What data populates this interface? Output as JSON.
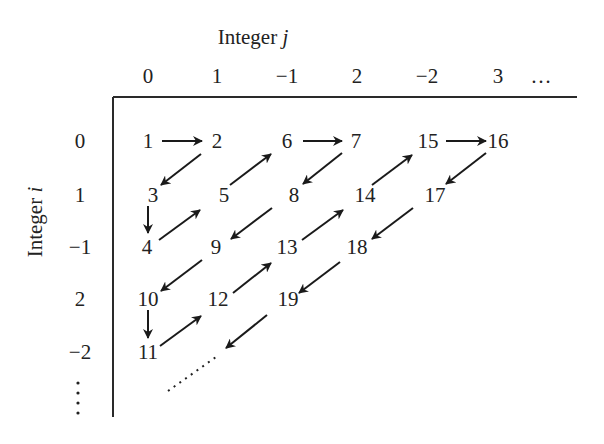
{
  "title": {
    "column_axis": {
      "prefix": "Integer ",
      "var": "j",
      "x": 253,
      "y": 44
    },
    "row_axis": {
      "prefix": "Integer ",
      "var": "i",
      "x": 48,
      "y": 228
    }
  },
  "columns": [
    {
      "label": "0",
      "x": 148
    },
    {
      "label": "1",
      "x": 217
    },
    {
      "label": "−1",
      "x": 287
    },
    {
      "label": "2",
      "x": 357
    },
    {
      "label": "−2",
      "x": 427
    },
    {
      "label": "3",
      "x": 498
    },
    {
      "label": "…",
      "x": 541
    }
  ],
  "column_label_y": 83,
  "rows": [
    {
      "label": "0",
      "y": 148
    },
    {
      "label": "1",
      "y": 202
    },
    {
      "label": "−1",
      "y": 254
    },
    {
      "label": "2",
      "y": 306
    },
    {
      "label": "−2",
      "y": 359
    }
  ],
  "row_label_x": 80,
  "row_ellipsis": {
    "x": 78,
    "y_start": 383,
    "y_end": 413,
    "count": 4
  },
  "axes": {
    "horizontal": {
      "x1": 113,
      "y1": 97,
      "x2": 577,
      "y2": 97
    },
    "vertical": {
      "x1": 113,
      "y1": 97,
      "x2": 113,
      "y2": 417
    }
  },
  "cells": [
    {
      "n": "1",
      "x": 148,
      "y": 148
    },
    {
      "n": "2",
      "x": 217,
      "y": 148
    },
    {
      "n": "3",
      "x": 153,
      "y": 202
    },
    {
      "n": "4",
      "x": 147,
      "y": 254
    },
    {
      "n": "5",
      "x": 224,
      "y": 202
    },
    {
      "n": "6",
      "x": 287,
      "y": 148
    },
    {
      "n": "7",
      "x": 356,
      "y": 148
    },
    {
      "n": "8",
      "x": 294,
      "y": 202
    },
    {
      "n": "9",
      "x": 216,
      "y": 254
    },
    {
      "n": "10",
      "x": 148,
      "y": 306
    },
    {
      "n": "11",
      "x": 148,
      "y": 359
    },
    {
      "n": "12",
      "x": 218,
      "y": 306
    },
    {
      "n": "13",
      "x": 287,
      "y": 254
    },
    {
      "n": "14",
      "x": 365,
      "y": 202
    },
    {
      "n": "15",
      "x": 428,
      "y": 148
    },
    {
      "n": "16",
      "x": 498,
      "y": 148
    },
    {
      "n": "17",
      "x": 435,
      "y": 202
    },
    {
      "n": "18",
      "x": 357,
      "y": 254
    },
    {
      "n": "19",
      "x": 288,
      "y": 306
    }
  ],
  "arrows": [
    {
      "from": "1",
      "to": "2",
      "x1": 162,
      "y1": 141,
      "x2": 202,
      "y2": 141
    },
    {
      "from": "2",
      "to": "3",
      "x1": 201,
      "y1": 154,
      "x2": 161,
      "y2": 185
    },
    {
      "from": "3",
      "to": "4",
      "x1": 148,
      "y1": 206,
      "x2": 148,
      "y2": 233
    },
    {
      "from": "4",
      "to": "5",
      "x1": 159,
      "y1": 240,
      "x2": 200,
      "y2": 210
    },
    {
      "from": "5",
      "to": "6",
      "x1": 230,
      "y1": 185,
      "x2": 271,
      "y2": 154
    },
    {
      "from": "6",
      "to": "7",
      "x1": 303,
      "y1": 141,
      "x2": 342,
      "y2": 141
    },
    {
      "from": "7",
      "to": "8",
      "x1": 342,
      "y1": 153,
      "x2": 303,
      "y2": 184
    },
    {
      "from": "8",
      "to": "9",
      "x1": 272,
      "y1": 208,
      "x2": 231,
      "y2": 239
    },
    {
      "from": "9",
      "to": "10",
      "x1": 202,
      "y1": 260,
      "x2": 161,
      "y2": 291
    },
    {
      "from": "10",
      "to": "11",
      "x1": 148,
      "y1": 310,
      "x2": 148,
      "y2": 338
    },
    {
      "from": "11",
      "to": "12",
      "x1": 160,
      "y1": 346,
      "x2": 201,
      "y2": 316
    },
    {
      "from": "12",
      "to": "13",
      "x1": 233,
      "y1": 293,
      "x2": 271,
      "y2": 263
    },
    {
      "from": "13",
      "to": "14",
      "x1": 302,
      "y1": 240,
      "x2": 343,
      "y2": 210
    },
    {
      "from": "14",
      "to": "15",
      "x1": 372,
      "y1": 185,
      "x2": 412,
      "y2": 155
    },
    {
      "from": "15",
      "to": "16",
      "x1": 446,
      "y1": 141,
      "x2": 486,
      "y2": 141
    },
    {
      "from": "16",
      "to": "17",
      "x1": 486,
      "y1": 153,
      "x2": 446,
      "y2": 184
    },
    {
      "from": "17",
      "to": "18",
      "x1": 413,
      "y1": 208,
      "x2": 372,
      "y2": 239
    },
    {
      "from": "18",
      "to": "19",
      "x1": 340,
      "y1": 262,
      "x2": 299,
      "y2": 293
    },
    {
      "from": "19",
      "to": "…",
      "x1": 267,
      "y1": 315,
      "x2": 226,
      "y2": 348
    }
  ],
  "continuation": {
    "x1": 168,
    "y1": 391,
    "x2": 216,
    "y2": 357
  },
  "colors": {
    "ink": "#1a1a1a",
    "background": "#ffffff"
  }
}
